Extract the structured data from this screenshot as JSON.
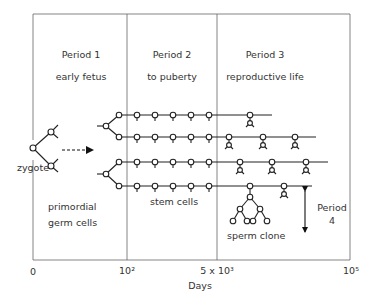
{
  "periods": [
    {
      "title": "Period 1",
      "subtitle": "early fetus"
    },
    {
      "title": "Period 2",
      "subtitle": "to puberty"
    },
    {
      "title": "Period 3",
      "subtitle": "reproductive life"
    },
    {
      "title": "Period",
      "subtitle": "4"
    }
  ],
  "labels": {
    "zygote": "zygote",
    "primordial_line1": "primordial",
    "primordial_line2": "germ cells",
    "stem_cells": "stem cells",
    "sperm_clone": "sperm clone"
  },
  "axis": {
    "ticks": [
      "0",
      "10²",
      "5 x 10³",
      "10⁵"
    ],
    "xlabel": "Days"
  },
  "colors": {
    "line": "#2a2a2a",
    "frame": "#555555",
    "background": "#ffffff"
  }
}
